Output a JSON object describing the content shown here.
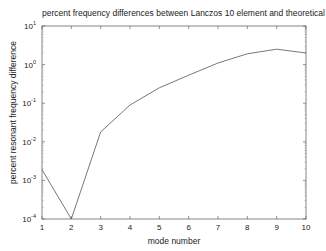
{
  "chart_data": {
    "type": "line",
    "title": "percent frequency differences between Lanczos 10 element and theoretical models",
    "xlabel": "mode number",
    "ylabel": "percent resonant frequency difference",
    "yscale": "log",
    "x": [
      1,
      2,
      3,
      4,
      5,
      6,
      7,
      8,
      9,
      10
    ],
    "series": [
      {
        "name": "percent difference",
        "values": [
          0.0019,
          0.0001,
          0.018,
          0.09,
          0.25,
          0.53,
          1.1,
          1.9,
          2.5,
          2.0
        ],
        "color": "#555555"
      }
    ],
    "xlim": [
      1,
      10
    ],
    "ylim": [
      0.0001,
      10
    ],
    "xticks": [
      "1",
      "2",
      "3",
      "4",
      "5",
      "6",
      "7",
      "8",
      "9",
      "10"
    ],
    "yticks": [
      {
        "base": "10",
        "exp": "-4"
      },
      {
        "base": "10",
        "exp": "-3"
      },
      {
        "base": "10",
        "exp": "-2"
      },
      {
        "base": "10",
        "exp": "-1"
      },
      {
        "base": "10",
        "exp": "0"
      },
      {
        "base": "10",
        "exp": "1"
      }
    ],
    "grid": false,
    "legend": null
  }
}
